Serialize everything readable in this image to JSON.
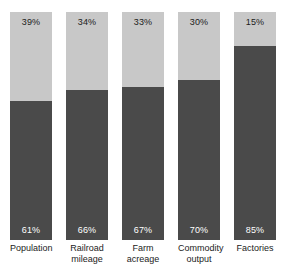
{
  "chart_data": {
    "type": "bar",
    "subtype": "stacked-100-percent",
    "title": "",
    "subtitle": "",
    "xlabel": "",
    "ylabel": "",
    "ylim": [
      0,
      100
    ],
    "grid": false,
    "legend": false,
    "legend_position": "none",
    "categories": [
      "Population",
      "Railroad mileage",
      "Farm acreage",
      "Commodity output",
      "Factories"
    ],
    "series": [
      {
        "name": "lower-share",
        "color": "#4a4a4a",
        "position": "bottom",
        "values": [
          61,
          66,
          67,
          70,
          85
        ],
        "labels": [
          "61%",
          "66%",
          "67%",
          "70%",
          "85%"
        ],
        "label_color": "#ffffff"
      },
      {
        "name": "upper-share",
        "color": "#c8c8c8",
        "position": "top",
        "values": [
          39,
          34,
          33,
          30,
          15
        ],
        "labels": [
          "39%",
          "34%",
          "33%",
          "30%",
          "15%"
        ],
        "label_color": "#1b1b1b"
      }
    ]
  },
  "axis": {
    "categories": [
      {
        "lines": [
          "Population"
        ]
      },
      {
        "lines": [
          "Railroad",
          "mileage"
        ]
      },
      {
        "lines": [
          "Farm",
          "acreage"
        ]
      },
      {
        "lines": [
          "Commodity",
          "output"
        ]
      },
      {
        "lines": [
          "Factories"
        ]
      }
    ]
  },
  "bars": [
    {
      "category": "Population",
      "top_label": "39%",
      "bottom_label": "61%",
      "top_value": 39,
      "bottom_value": 61
    },
    {
      "category": "Railroad mileage",
      "top_label": "34%",
      "bottom_label": "66%",
      "top_value": 34,
      "bottom_value": 66
    },
    {
      "category": "Farm acreage",
      "top_label": "33%",
      "bottom_label": "67%",
      "top_value": 33,
      "bottom_value": 67
    },
    {
      "category": "Commodity output",
      "top_label": "30%",
      "bottom_label": "70%",
      "top_value": 30,
      "bottom_value": 70
    },
    {
      "category": "Factories",
      "top_label": "15%",
      "bottom_label": "85%",
      "top_value": 15,
      "bottom_value": 85
    }
  ],
  "colors": {
    "background": "#ffffff",
    "segment_top": "#c8c8c8",
    "segment_bottom": "#4a4a4a",
    "label_dark": "#1b1b1b",
    "label_light": "#ffffff"
  }
}
